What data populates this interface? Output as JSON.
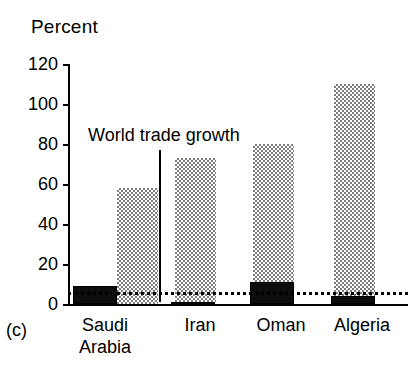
{
  "figure": {
    "panel_label": "(c)",
    "axis_title": "Percent",
    "annotation": "World trade growth"
  },
  "chart_data": {
    "type": "bar",
    "title": "Percent",
    "xlabel": "",
    "ylabel": "Percent",
    "ylim": [
      0,
      120
    ],
    "yticks": [
      0,
      20,
      40,
      60,
      80,
      100,
      120
    ],
    "grid": false,
    "legend": false,
    "categories": [
      "Saudi\nArabia",
      "Iran",
      "Oman",
      "Algeria"
    ],
    "series": [
      {
        "name": "dark",
        "values": [
          9,
          1,
          11,
          4
        ]
      },
      {
        "name": "shaded",
        "values": [
          58,
          73,
          80,
          110
        ]
      }
    ],
    "reference_line": {
      "label": "World trade growth",
      "value": 6,
      "style": "dotted"
    }
  },
  "ticks": [
    {
      "label": "120",
      "value": 120
    },
    {
      "label": "100",
      "value": 100
    },
    {
      "label": "80",
      "value": 80
    },
    {
      "label": "60",
      "value": 60
    },
    {
      "label": "40",
      "value": 40
    },
    {
      "label": "20",
      "value": 20
    },
    {
      "label": "0",
      "value": 0
    }
  ],
  "categories": [
    {
      "label": "Saudi\nArabia"
    },
    {
      "label": "Iran"
    },
    {
      "label": "Oman"
    },
    {
      "label": "Algeria"
    }
  ]
}
